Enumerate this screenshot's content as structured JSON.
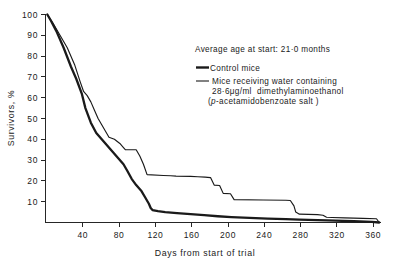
{
  "figure": {
    "caption_note": "Survival curves of control and dimethylaminoethanol-treated mice"
  },
  "annotations": {
    "average_age": "Average age at start: 21·0 months"
  },
  "legend": {
    "entries": [
      {
        "key": "control",
        "label": "Control mice",
        "line_style": "thick"
      },
      {
        "key": "treated",
        "label_line1": "Mice receiving water containing",
        "label_line2_prefix": "28·6",
        "label_line2_unit": "μg/ml",
        "label_line2_suffix": "dimethylaminoethanol",
        "label_line3_open": "(",
        "label_line3_italic": "p",
        "label_line3_rest": "-acetamidobenzoate salt )",
        "line_style": "thin"
      }
    ]
  },
  "chart_data": {
    "type": "line",
    "title": "",
    "subtitle": "",
    "xlabel": "Days from start of trial",
    "ylabel": "Survivors, %",
    "xlim": [
      0,
      370
    ],
    "ylim": [
      0,
      100
    ],
    "xticks": [
      40,
      80,
      120,
      160,
      200,
      240,
      280,
      320,
      360
    ],
    "xtick_labels": [
      "40",
      "80",
      "120",
      "160",
      "200",
      "240",
      "280",
      "320",
      "360"
    ],
    "yticks": [
      10,
      20,
      30,
      40,
      50,
      60,
      70,
      80,
      90,
      100
    ],
    "ytick_labels": [
      "10",
      "20",
      "30",
      "40",
      "50",
      "60",
      "70",
      "80",
      "90",
      "100"
    ],
    "grid": false,
    "legend_position": "upper-right-inside",
    "annotations": [
      "Average age at start: 21·0 months"
    ],
    "series": [
      {
        "name": "Control mice",
        "style": "thick",
        "color": "#1a1a1a",
        "x": [
          2,
          6,
          12,
          20,
          28,
          34,
          40,
          44,
          50,
          56,
          62,
          68,
          74,
          80,
          86,
          90,
          95,
          100,
          106,
          110,
          114,
          116,
          118,
          124,
          132,
          145,
          160,
          175,
          190,
          205,
          225,
          245,
          265,
          280,
          300,
          320,
          340,
          360,
          368
        ],
        "y": [
          100,
          97,
          92,
          84,
          75,
          69,
          62,
          55,
          48,
          43,
          40,
          37,
          34,
          31,
          28,
          25,
          21,
          18,
          15,
          12,
          9,
          7,
          6,
          5.5,
          5,
          4.5,
          4,
          3.5,
          3,
          2.6,
          2.2,
          1.9,
          1.6,
          1.4,
          1.1,
          0.9,
          0.6,
          0.3,
          0
        ]
      },
      {
        "name": "Mice receiving water containing 28·6 μg/ml dimethylaminoethanol (p-acetamidobenzoate salt)",
        "style": "thin",
        "color": "#1a1a1a",
        "x": [
          2,
          8,
          16,
          24,
          32,
          38,
          42,
          46,
          50,
          54,
          58,
          62,
          66,
          70,
          76,
          82,
          86,
          88,
          92,
          100,
          104,
          108,
          112,
          130,
          138,
          144,
          160,
          168,
          176,
          182,
          186,
          192,
          196,
          204,
          208,
          240,
          265,
          270,
          274,
          276,
          280,
          290,
          300,
          306,
          310,
          316,
          330,
          350,
          365,
          368
        ],
        "y": [
          100,
          96,
          90,
          84,
          76,
          68,
          63,
          61,
          58,
          54,
          50,
          47,
          44,
          41,
          40,
          38,
          36,
          35,
          35,
          35,
          32,
          28,
          23,
          22.6,
          22.5,
          22.3,
          22.2,
          22,
          21.8,
          21.6,
          18,
          17.8,
          14,
          13.8,
          11,
          10.8,
          10.7,
          10.6,
          8,
          5,
          4,
          3.9,
          3.8,
          3.5,
          2.5,
          2.4,
          2.2,
          2,
          1.8,
          0
        ]
      }
    ]
  }
}
